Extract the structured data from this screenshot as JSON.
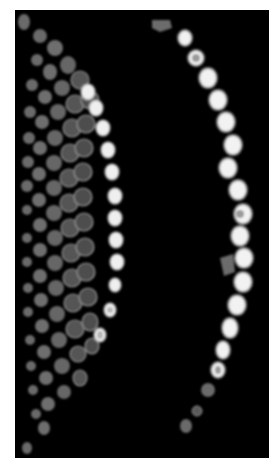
{
  "image": {
    "description": "Grayscale fluorescence micrograph of two curved arcs of cells on black background",
    "background": "#000000",
    "frame": "#ffffff",
    "panel": {
      "x": 15,
      "y": 10,
      "width": 254,
      "height": 448
    }
  },
  "colors": {
    "dim_cell": "#6e6e6e",
    "mid_cell": "#555555",
    "bright_cell": "#f2f2f2",
    "cell_outline": "#8a8a8a"
  }
}
